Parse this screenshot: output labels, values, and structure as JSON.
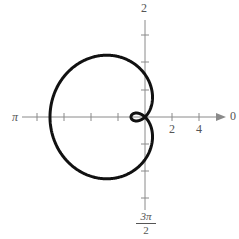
{
  "chart_data": {
    "type": "line",
    "subtype": "polar",
    "title": "",
    "axis_labels": {
      "right": "0",
      "left": "π",
      "top": "2",
      "bottom": "3π/2"
    },
    "tick_labels": [
      "2",
      "4"
    ],
    "tick_spacing_units": 2,
    "curve": {
      "form": "r = a - b·cos(θ)",
      "outer_extent_left": 7,
      "inner_loop_extent": 1,
      "color": "#111111"
    },
    "grid": false
  },
  "labels": {
    "zero": "0",
    "pi": "π",
    "top": "2",
    "bottom_num": "3π",
    "bottom_den": "2",
    "tick_2": "2",
    "tick_4": "4"
  },
  "colors": {
    "axis": "#8a8a8a",
    "curve": "#111111"
  }
}
